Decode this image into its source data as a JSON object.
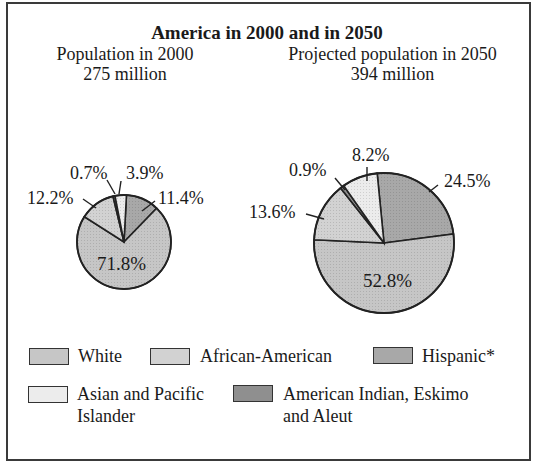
{
  "chart_data": [
    {
      "type": "pie",
      "title": "Population in 2000",
      "subtitle": "275 million",
      "total_millions": 275,
      "slices": [
        {
          "name": "White",
          "value": 71.8,
          "label": "71.8%"
        },
        {
          "name": "African-American",
          "value": 12.2,
          "label": "12.2%"
        },
        {
          "name": "Hispanic*",
          "value": 11.4,
          "label": "11.4%"
        },
        {
          "name": "Asian and Pacific Islander",
          "value": 3.9,
          "label": "3.9%"
        },
        {
          "name": "American Indian, Eskimo and Aleut",
          "value": 0.7,
          "label": "0.7%"
        }
      ]
    },
    {
      "type": "pie",
      "title": "Projected population in 2050",
      "subtitle": "394 million",
      "total_millions": 394,
      "slices": [
        {
          "name": "White",
          "value": 52.8,
          "label": "52.8%"
        },
        {
          "name": "African-American",
          "value": 13.6,
          "label": "13.6%"
        },
        {
          "name": "Hispanic*",
          "value": 24.5,
          "label": "24.5%"
        },
        {
          "name": "Asian and Pacific Islander",
          "value": 8.2,
          "label": "8.2%"
        },
        {
          "name": "American Indian, Eskimo and Aleut",
          "value": 0.9,
          "label": "0.9%"
        }
      ]
    }
  ],
  "figure": {
    "title": "America in 2000 and in 2050",
    "left": {
      "line1": "Population in 2000",
      "line2": "275 million"
    },
    "right": {
      "line1": "Projected population in 2050",
      "line2": "394 million"
    }
  },
  "labels2000": {
    "white": "71.8%",
    "african": "12.2%",
    "hispanic": "11.4%",
    "asian": "3.9%",
    "indian": "0.7%"
  },
  "labels2050": {
    "white": "52.8%",
    "african": "13.6%",
    "hispanic": "24.5%",
    "asian": "8.2%",
    "indian": "0.9%"
  },
  "legend": {
    "white": "White",
    "african": "African-American",
    "hispanic": "Hispanic*",
    "asian_l1": "Asian and Pacific",
    "asian_l2": "Islander",
    "indian_l1": "American Indian, Eskimo",
    "indian_l2": "and Aleut"
  },
  "colors": {
    "white": "#c6c6c6",
    "african": "#d2d2d2",
    "hispanic": "#a8a8a8",
    "asian": "#ececec",
    "indian": "#8f8f8f",
    "stroke": "#222222"
  }
}
